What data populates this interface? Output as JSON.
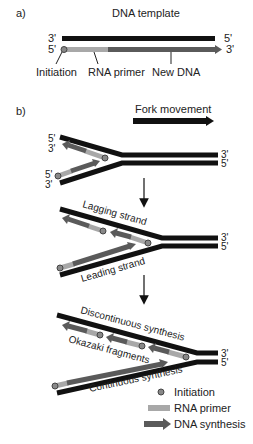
{
  "panel_a": {
    "label": "a)",
    "title": "DNA template",
    "template_left": "3'",
    "template_right": "5'",
    "new_left": "5'",
    "new_right": "3'",
    "annotations": [
      "Initiation",
      "RNA primer",
      "New DNA"
    ]
  },
  "panel_b": {
    "label": "b)",
    "fork_movement": "Fork movement",
    "stage1": {
      "top_left": "5'",
      "top_left2": "3'",
      "bottom_left": "5'",
      "bottom_left2": "3'",
      "right_top": "3'",
      "right_bottom": "5'"
    },
    "stage2": {
      "lagging": "Lagging strand",
      "leading": "Leading strand",
      "right_top": "3'",
      "right_bottom": "5'"
    },
    "stage3": {
      "discontinuous": "Discontinuous synthesis",
      "okazaki": "Okazaki fragments",
      "continuous": "Continuous synthesis",
      "right_top": "3'",
      "right_bottom": "5'"
    }
  },
  "legend": {
    "items": [
      {
        "label": "Initiation",
        "symbol": "circle"
      },
      {
        "label": "RNA primer",
        "symbol": "light-bar"
      },
      {
        "label": "DNA synthesis",
        "symbol": "dark-arrow"
      }
    ]
  },
  "colors": {
    "strand": "#111111",
    "primer": "#a8a8a8",
    "synthesis": "#5a5a5a",
    "initiation": "#777777"
  }
}
